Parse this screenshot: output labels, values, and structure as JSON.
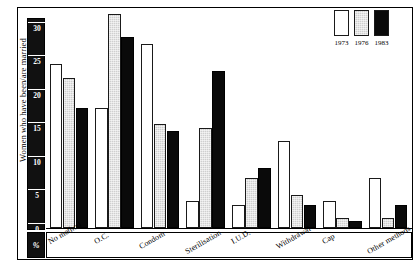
{
  "chart_data": {
    "type": "bar",
    "title": "",
    "xlabel": "",
    "ylabel": "Women who have been/are married",
    "unit_label": "%",
    "ylim": [
      0,
      32
    ],
    "yticks": [
      0,
      5,
      10,
      15,
      20,
      25,
      30
    ],
    "grid": false,
    "legend_position": "top-right",
    "categories": [
      "No method",
      "O.C.",
      "Condom",
      "Sterilisation",
      "I.U.D.",
      "Withdrawal",
      "Cap",
      "Other methods"
    ],
    "series": [
      {
        "name": "1973",
        "color": "#ffffff",
        "values": [
          24.5,
          18.0,
          27.5,
          4.0,
          3.5,
          13.0,
          4.0,
          7.5
        ]
      },
      {
        "name": "1976",
        "color": "#cfcfcf",
        "values": [
          22.5,
          32.0,
          15.5,
          15.0,
          7.5,
          5.0,
          1.5,
          1.5
        ]
      },
      {
        "name": "1983",
        "color": "#0a0a0a",
        "values": [
          18.0,
          28.5,
          14.5,
          23.5,
          9.0,
          3.5,
          1.0,
          3.5
        ]
      }
    ]
  },
  "legend": {
    "entries": [
      {
        "label": "1973"
      },
      {
        "label": "1976"
      },
      {
        "label": "1983"
      }
    ]
  },
  "axis": {
    "y_title": "Women who have been/are married",
    "percent_symbol": "%",
    "tick_labels": [
      "30",
      "25",
      "20",
      "15",
      "10",
      "5",
      "0"
    ]
  }
}
